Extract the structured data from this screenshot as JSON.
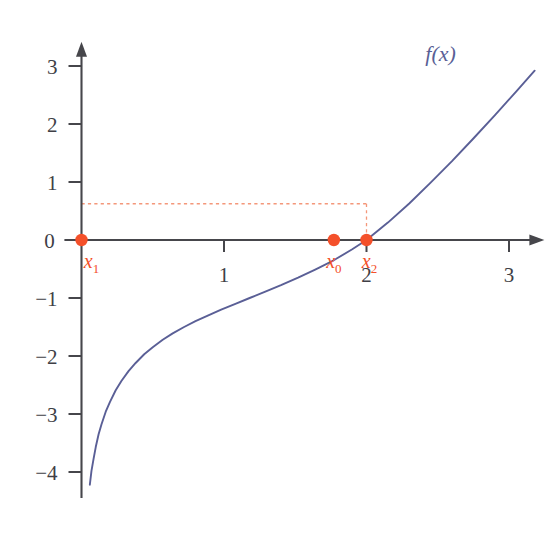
{
  "chart_data": {
    "type": "line",
    "title": "",
    "subtitle": "",
    "xlabel": "",
    "ylabel": "",
    "xlim": [
      -0.12,
      3.22
    ],
    "ylim": [
      -4.45,
      3.35
    ],
    "grid": false,
    "legend_position": "top-right-inline",
    "curve_label": "f(x)",
    "curve_label_f": "f",
    "curve_label_open": "(",
    "curve_label_x": "x",
    "curve_label_close": ")",
    "curve_color": "#5a5f96",
    "axis_color": "#46464b",
    "marker_color": "#f4502a",
    "dash_color": "#f4977a",
    "tick_label_color": "#3f3f46",
    "x_ticks": [
      {
        "value": 1,
        "label": "1"
      },
      {
        "value": 2,
        "label": "2"
      },
      {
        "value": 3,
        "label": "3"
      }
    ],
    "y_ticks": [
      {
        "value": 3,
        "label": "3"
      },
      {
        "value": 2,
        "label": "2"
      },
      {
        "value": 1,
        "label": "1"
      },
      {
        "value": 0,
        "label": "0"
      },
      {
        "value": -1,
        "label": "−1"
      },
      {
        "value": -2,
        "label": "−2"
      },
      {
        "value": -3,
        "label": "−3"
      },
      {
        "value": -4,
        "label": "−4"
      }
    ],
    "series": [
      {
        "name": "f(x)",
        "x": [
          0.0585,
          0.07,
          0.085,
          0.1,
          0.12,
          0.14,
          0.17,
          0.2,
          0.24,
          0.28,
          0.33,
          0.38,
          0.44,
          0.5,
          0.57,
          0.64,
          0.72,
          0.8,
          0.89,
          0.98,
          1.08,
          1.18,
          1.29,
          1.4,
          1.52,
          1.64,
          1.77,
          1.9,
          2.0,
          2.15,
          2.3,
          2.45,
          2.6,
          2.75,
          2.9,
          3.05,
          3.18
        ],
        "y": [
          -4.22,
          -3.98,
          -3.77,
          -3.57,
          -3.35,
          -3.18,
          -2.96,
          -2.79,
          -2.59,
          -2.43,
          -2.26,
          -2.12,
          -1.97,
          -1.85,
          -1.72,
          -1.61,
          -1.5,
          -1.4,
          -1.3,
          -1.2,
          -1.1,
          -1.0,
          -0.89,
          -0.78,
          -0.65,
          -0.51,
          -0.35,
          -0.16,
          0.0,
          0.3,
          0.63,
          0.99,
          1.36,
          1.75,
          2.15,
          2.56,
          2.92
        ]
      }
    ],
    "markers": [
      {
        "name": "x1",
        "base": "x",
        "sub": "1",
        "x": 0.0,
        "y": 0.0,
        "label_dx": 10,
        "label_dy": 28
      },
      {
        "name": "x0",
        "base": "x",
        "sub": "0",
        "x": 1.771,
        "y": 0.0,
        "label_dx": 0,
        "label_dy": 28
      },
      {
        "name": "x2",
        "base": "x",
        "sub": "2",
        "x": 2.0,
        "y": 0.0,
        "label_dx": 3,
        "label_dy": 28
      }
    ],
    "guide_lines": [
      {
        "name": "horizontal-guide",
        "orientation": "horizontal",
        "y": 0.625,
        "x_from": 0.0,
        "x_to": 2.0,
        "style": "dotted"
      },
      {
        "name": "vertical-guide",
        "orientation": "vertical",
        "x": 2.0,
        "y_from": 0.625,
        "y_to": 0.0,
        "style": "dotted"
      }
    ],
    "annotations": [
      {
        "name": "curve-label",
        "text": "f(x)",
        "x": 2.52,
        "y": 3.08
      }
    ]
  }
}
